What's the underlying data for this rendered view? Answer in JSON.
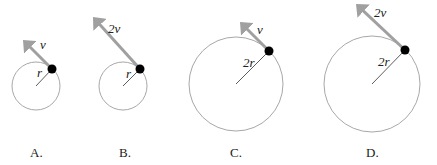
{
  "diagrams": [
    {
      "id": "A",
      "option_label": "A.",
      "speed_label": "v",
      "radius_label": "r",
      "circle": {
        "cx": 36,
        "cy": 86,
        "r": 24
      },
      "particle": {
        "x": 52,
        "y": 69
      },
      "arrow_tip": {
        "x": 23,
        "y": 40
      },
      "speed_label_pos": {
        "x": 40,
        "y": 49
      },
      "radius_label_pos": {
        "x": 37,
        "y": 77
      },
      "option_label_pos": {
        "x": 30,
        "y": 157
      }
    },
    {
      "id": "B",
      "option_label": "B.",
      "speed_label": "2v",
      "radius_label": "r",
      "circle": {
        "cx": 123,
        "cy": 86,
        "r": 24
      },
      "particle": {
        "x": 140,
        "y": 69
      },
      "arrow_tip": {
        "x": 93,
        "y": 17
      },
      "speed_label_pos": {
        "x": 108,
        "y": 33
      },
      "radius_label_pos": {
        "x": 126,
        "y": 78
      },
      "option_label_pos": {
        "x": 119,
        "y": 157
      }
    },
    {
      "id": "C",
      "option_label": "C.",
      "speed_label": "v",
      "radius_label": "2r",
      "circle": {
        "cx": 236,
        "cy": 84,
        "r": 47
      },
      "particle": {
        "x": 269,
        "y": 51
      },
      "arrow_tip": {
        "x": 240,
        "y": 22
      },
      "speed_label_pos": {
        "x": 257,
        "y": 34
      },
      "radius_label_pos": {
        "x": 243,
        "y": 67
      },
      "option_label_pos": {
        "x": 230,
        "y": 157
      }
    },
    {
      "id": "D",
      "option_label": "D.",
      "speed_label": "2v",
      "radius_label": "2r",
      "circle": {
        "cx": 372,
        "cy": 84,
        "r": 48
      },
      "particle": {
        "x": 405,
        "y": 50
      },
      "arrow_tip": {
        "x": 356,
        "y": 4
      },
      "speed_label_pos": {
        "x": 374,
        "y": 17
      },
      "radius_label_pos": {
        "x": 378,
        "y": 66
      },
      "option_label_pos": {
        "x": 366,
        "y": 157
      }
    }
  ],
  "colors": {
    "circle": "#a8a8a8",
    "arrow": "#a0a0a0",
    "particle": "#000000",
    "radius_line": "#333333",
    "text": "#222222"
  }
}
